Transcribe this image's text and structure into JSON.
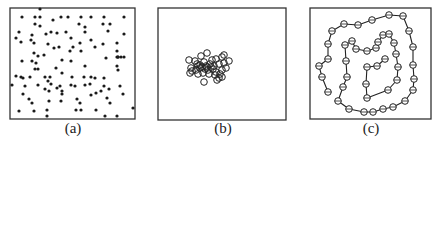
{
  "figure": {
    "panels": [
      {
        "id": "a",
        "caption": "(a)",
        "description": "Uniformly scattered small filled dots",
        "box": {
          "x": 10,
          "y": 8,
          "w": 125,
          "h": 111
        },
        "caption_pos": {
          "x": 53,
          "y": 120
        },
        "marker": "filled-dot",
        "points": [
          [
            40,
            9
          ],
          [
            22,
            17
          ],
          [
            35,
            17
          ],
          [
            40,
            17
          ],
          [
            53,
            20
          ],
          [
            61,
            17
          ],
          [
            68,
            17
          ],
          [
            81,
            17
          ],
          [
            91,
            17
          ],
          [
            104,
            17
          ],
          [
            124,
            17
          ],
          [
            35,
            24
          ],
          [
            40,
            26
          ],
          [
            79,
            24
          ],
          [
            85,
            27
          ],
          [
            103,
            24
          ],
          [
            110,
            24
          ],
          [
            19,
            32
          ],
          [
            32,
            35
          ],
          [
            46,
            34
          ],
          [
            51,
            32
          ],
          [
            57,
            33
          ],
          [
            66,
            32
          ],
          [
            85,
            32
          ],
          [
            108,
            31
          ],
          [
            124,
            34
          ],
          [
            16,
            38
          ],
          [
            21,
            42
          ],
          [
            31,
            40
          ],
          [
            34,
            43
          ],
          [
            48,
            44
          ],
          [
            71,
            38
          ],
          [
            80,
            43
          ],
          [
            91,
            40
          ],
          [
            103,
            44
          ],
          [
            117,
            43
          ],
          [
            54,
            48
          ],
          [
            59,
            47
          ],
          [
            70,
            51
          ],
          [
            73,
            47
          ],
          [
            81,
            51
          ],
          [
            95,
            47
          ],
          [
            117,
            51
          ],
          [
            34,
            53
          ],
          [
            38,
            56
          ],
          [
            44,
            55
          ],
          [
            117,
            57
          ],
          [
            118,
            57
          ],
          [
            121,
            57
          ],
          [
            124,
            57
          ],
          [
            22,
            61
          ],
          [
            32,
            61
          ],
          [
            36,
            63
          ],
          [
            62,
            60
          ],
          [
            71,
            61
          ],
          [
            106,
            58
          ],
          [
            118,
            57
          ],
          [
            35,
            69
          ],
          [
            38,
            69
          ],
          [
            56,
            68
          ],
          [
            85,
            66
          ],
          [
            117,
            66
          ],
          [
            118,
            70
          ],
          [
            16,
            76
          ],
          [
            21,
            77
          ],
          [
            23,
            78
          ],
          [
            30,
            77
          ],
          [
            45,
            77
          ],
          [
            50,
            77
          ],
          [
            62,
            73
          ],
          [
            72,
            77
          ],
          [
            84,
            77
          ],
          [
            91,
            77
          ],
          [
            95,
            78
          ],
          [
            104,
            78
          ],
          [
            12,
            85
          ],
          [
            25,
            86
          ],
          [
            38,
            85
          ],
          [
            48,
            81
          ],
          [
            51,
            84
          ],
          [
            57,
            88
          ],
          [
            60,
            86
          ],
          [
            71,
            85
          ],
          [
            75,
            86
          ],
          [
            85,
            85
          ],
          [
            90,
            84
          ],
          [
            104,
            86
          ],
          [
            120,
            86
          ],
          [
            23,
            94
          ],
          [
            45,
            89
          ],
          [
            49,
            91
          ],
          [
            62,
            91
          ],
          [
            62,
            94
          ],
          [
            96,
            93
          ],
          [
            101,
            91
          ],
          [
            109,
            89
          ],
          [
            123,
            94
          ],
          [
            29,
            99
          ],
          [
            32,
            103
          ],
          [
            49,
            101
          ],
          [
            61,
            101
          ],
          [
            77,
            99
          ],
          [
            80,
            103
          ],
          [
            91,
            95
          ],
          [
            107,
            98
          ],
          [
            110,
            103
          ],
          [
            19,
            111
          ],
          [
            34,
            111
          ],
          [
            47,
            110
          ],
          [
            76,
            110
          ],
          [
            81,
            110
          ],
          [
            96,
            110
          ],
          [
            47,
            116
          ],
          [
            105,
            116
          ],
          [
            117,
            116
          ],
          [
            133,
            108
          ]
        ]
      },
      {
        "id": "b",
        "caption": "(b)",
        "description": "Tight cluster of hollow circles",
        "box": {
          "x": 158,
          "y": 8,
          "w": 128,
          "h": 112
        },
        "caption_pos": {
          "x": 203,
          "y": 120
        },
        "marker": "hollow-circle",
        "points": [
          [
            189,
            60
          ],
          [
            195,
            61
          ],
          [
            201,
            56
          ],
          [
            207,
            53
          ],
          [
            212,
            60
          ],
          [
            216,
            59
          ],
          [
            222,
            57
          ],
          [
            224,
            55
          ],
          [
            229,
            61
          ],
          [
            191,
            68
          ],
          [
            197,
            64
          ],
          [
            200,
            65
          ],
          [
            204,
            62
          ],
          [
            206,
            66
          ],
          [
            210,
            64
          ],
          [
            214,
            66
          ],
          [
            219,
            64
          ],
          [
            224,
            63
          ],
          [
            192,
            71
          ],
          [
            196,
            70
          ],
          [
            200,
            68
          ],
          [
            205,
            69
          ],
          [
            208,
            70
          ],
          [
            213,
            69
          ],
          [
            216,
            72
          ],
          [
            222,
            70
          ],
          [
            226,
            68
          ],
          [
            190,
            73
          ],
          [
            198,
            74
          ],
          [
            203,
            73
          ],
          [
            209,
            74
          ],
          [
            215,
            75
          ],
          [
            220,
            74
          ],
          [
            219,
            78
          ],
          [
            217,
            80
          ],
          [
            222,
            77
          ],
          [
            204,
            82
          ],
          [
            198,
            66
          ],
          [
            202,
            67
          ],
          [
            207,
            67
          ],
          [
            211,
            67
          ]
        ]
      },
      {
        "id": "c",
        "caption": "(c)",
        "description": "Hollow circles connected by a winding spiral path",
        "box": {
          "x": 310,
          "y": 8,
          "w": 121,
          "h": 111
        },
        "caption_pos": {
          "x": 351,
          "y": 120
        },
        "marker": "hollow-circle-on-path",
        "path": [
          [
            328,
            92
          ],
          [
            322,
            77
          ],
          [
            319,
            66
          ],
          [
            328,
            59
          ],
          [
            328,
            44
          ],
          [
            332,
            31
          ],
          [
            344,
            24
          ],
          [
            358,
            25
          ],
          [
            372,
            20
          ],
          [
            389,
            15
          ],
          [
            403,
            16
          ],
          [
            409,
            31
          ],
          [
            413,
            47
          ],
          [
            413,
            65
          ],
          [
            414,
            79
          ],
          [
            413,
            90
          ],
          [
            405,
            101
          ],
          [
            393,
            107
          ],
          [
            383,
            109
          ],
          [
            373,
            112
          ],
          [
            364,
            112
          ],
          [
            349,
            109
          ],
          [
            338,
            101
          ],
          [
            343,
            87
          ],
          [
            347,
            77
          ],
          [
            346,
            61
          ],
          [
            345,
            45
          ],
          [
            352,
            41
          ],
          [
            356,
            49
          ],
          [
            367,
            51
          ],
          [
            376,
            48
          ],
          [
            378,
            42
          ],
          [
            383,
            35
          ],
          [
            389,
            34
          ],
          [
            394,
            43
          ],
          [
            396,
            54
          ],
          [
            398,
            67
          ],
          [
            397,
            80
          ],
          [
            388,
            90
          ],
          [
            367,
            98
          ],
          [
            366,
            84
          ],
          [
            367,
            67
          ],
          [
            377,
            66
          ],
          [
            385,
            59
          ]
        ]
      }
    ]
  }
}
